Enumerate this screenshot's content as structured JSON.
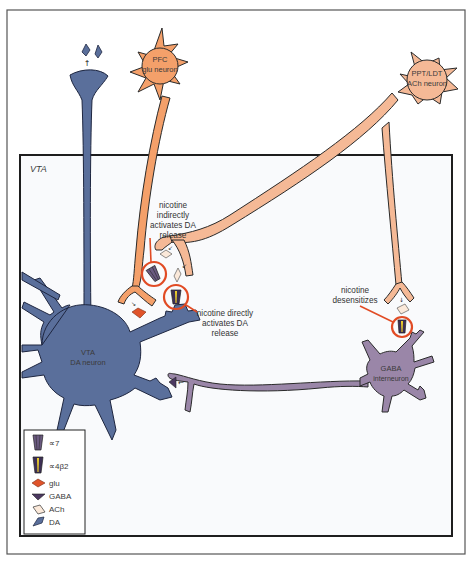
{
  "figure": {
    "region_label": "VTA",
    "colors": {
      "da_neuron": "#5a6f9b",
      "pfc_neuron": "#f4a06a",
      "ach_neuron": "#f5b996",
      "gaba_neuron": "#9a86a8",
      "highlight_ring": "#e14b24",
      "inner_bg": "#f9fafc",
      "outline": "#2a2a2a"
    },
    "neurons": [
      {
        "id": "pfc",
        "line1": "PFC",
        "line2": "glu neuron"
      },
      {
        "id": "ppt",
        "line1": "PPT/LDT",
        "line2": "ACh neuron"
      },
      {
        "id": "vta",
        "line1": "VTA",
        "line2": "DA neuron"
      },
      {
        "id": "gaba",
        "line1": "GABA",
        "line2": "interneuron"
      }
    ],
    "annotations": [
      {
        "id": "indirect",
        "lines": [
          "nicotine",
          "indirectly",
          "activates DA",
          "release"
        ]
      },
      {
        "id": "direct",
        "lines": [
          "nicotine directly",
          "activates DA",
          "release"
        ]
      },
      {
        "id": "desens",
        "lines": [
          "nicotine",
          "desensitizes"
        ]
      }
    ]
  },
  "legend": {
    "items": [
      {
        "symbol": "alpha7-receptor",
        "label": "∝7"
      },
      {
        "symbol": "alpha4beta2-receptor",
        "label": "∝4β2"
      },
      {
        "symbol": "glu",
        "label": "glu"
      },
      {
        "symbol": "gaba",
        "label": "GABA"
      },
      {
        "symbol": "ach",
        "label": "ACh"
      },
      {
        "symbol": "da",
        "label": "DA"
      }
    ]
  }
}
